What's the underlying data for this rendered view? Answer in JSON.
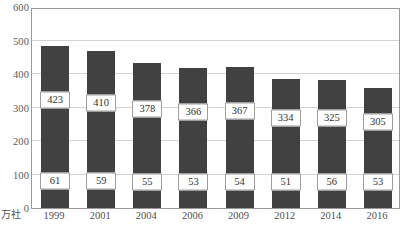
{
  "chart_data": {
    "type": "bar",
    "stacked": true,
    "title": "",
    "subtitle": "",
    "xlabel": "",
    "ylabel": "",
    "unit_label": "万社",
    "categories": [
      "1999",
      "2001",
      "2004",
      "2006",
      "2009",
      "2012",
      "2014",
      "2016"
    ],
    "series": [
      {
        "name": "lower-segment",
        "values": [
          61,
          59,
          55,
          53,
          54,
          51,
          56,
          53
        ]
      },
      {
        "name": "upper-segment",
        "values": [
          423,
          410,
          378,
          366,
          367,
          334,
          325,
          305
        ]
      }
    ],
    "totals": [
      484,
      469,
      433,
      419,
      421,
      385,
      381,
      358
    ],
    "ylim": [
      0,
      600
    ],
    "yticks": [
      0,
      100,
      200,
      300,
      400,
      500,
      600
    ],
    "ytick_labels": [
      "0",
      "100",
      "200",
      "300",
      "400",
      "500",
      "600"
    ],
    "grid": true,
    "grid_axis": "y",
    "legend": "none",
    "bar_color": "#414141",
    "grid_color": "#d2d2d2",
    "frame_color": "#9a9a9a",
    "label_box_border": "#9d9d9d",
    "label_box_fill": "#ffffff",
    "background": "#ffffff"
  },
  "caption": {
    "text": ""
  }
}
